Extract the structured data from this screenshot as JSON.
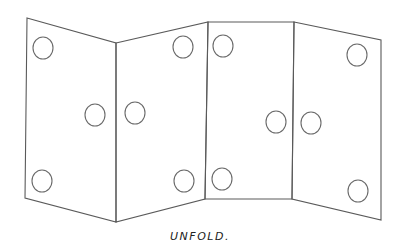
{
  "diagram": {
    "caption": "UNFOLD.",
    "panels": [
      {
        "name": "panel-1",
        "corners": [
          [
            27,
            18
          ],
          [
            116,
            43
          ],
          [
            116,
            222
          ],
          [
            25,
            198
          ]
        ],
        "holes": [
          [
            43,
            48
          ],
          [
            95,
            115
          ],
          [
            42,
            181
          ]
        ]
      },
      {
        "name": "panel-2",
        "corners": [
          [
            116,
            43
          ],
          [
            208,
            22
          ],
          [
            205,
            199
          ],
          [
            116,
            222
          ]
        ],
        "holes": [
          [
            183,
            47
          ],
          [
            135,
            113
          ],
          [
            184,
            181
          ]
        ]
      },
      {
        "name": "panel-3",
        "corners": [
          [
            208,
            22
          ],
          [
            294,
            22
          ],
          [
            292,
            199
          ],
          [
            205,
            199
          ]
        ],
        "holes": [
          [
            223,
            46
          ],
          [
            276,
            122
          ],
          [
            222,
            179
          ]
        ]
      },
      {
        "name": "panel-4",
        "corners": [
          [
            294,
            22
          ],
          [
            381,
            40
          ],
          [
            381,
            220
          ],
          [
            292,
            199
          ]
        ],
        "holes": [
          [
            357,
            55
          ],
          [
            311,
            123
          ],
          [
            358,
            191
          ]
        ]
      }
    ],
    "hole_radius": 10,
    "line_color": "#5a5a5a"
  }
}
